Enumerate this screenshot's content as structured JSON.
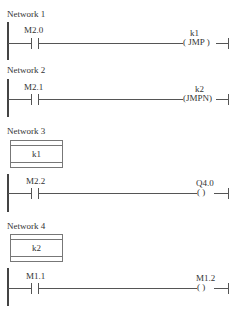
{
  "networks": [
    {
      "title": "Network 1",
      "contact": "M2.0",
      "coil_operand": "k1",
      "coil_label": "( JMP )"
    },
    {
      "title": "Network 2",
      "contact": "M2.1",
      "coil_operand": "k2",
      "coil_label": "(JMPN)"
    },
    {
      "title": "Network 3",
      "jump_label": "k1",
      "contact": "M2.2",
      "coil_operand": "Q4.0",
      "coil_label": "(  )"
    },
    {
      "title": "Network 4",
      "jump_label": "k2",
      "contact": "M1.1",
      "coil_operand": "M1.2",
      "coil_label": "(  )"
    }
  ]
}
